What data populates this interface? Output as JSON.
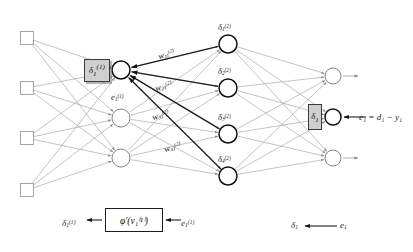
{
  "figure": {
    "background_color": "#ffffff",
    "line_color": "#a9a9a9",
    "dark_line_color": "#1c1c1c",
    "node_stroke_color": "#6f6f6f",
    "highlight_node_stroke_color": "#111111",
    "box_fill_color": "#cfcfcf",
    "box_stroke_color": "#3a3a3a"
  },
  "layers": {
    "input": {
      "name": "input-layer",
      "shape": "square",
      "count": 4,
      "x": 27,
      "ys": [
        38,
        88,
        138,
        190
      ],
      "size": 13
    },
    "hidden1": {
      "name": "hidden-layer-1",
      "shape": "circle",
      "count": 3,
      "x": 121,
      "ys": [
        70,
        118,
        158
      ],
      "radius": 9,
      "highlight_index": 0
    },
    "hidden2": {
      "name": "hidden-layer-2",
      "shape": "circle",
      "count": 4,
      "x": 228,
      "ys": [
        44,
        88,
        134,
        176
      ],
      "radius": 9,
      "highlight_all": true
    },
    "output": {
      "name": "output-layer",
      "shape": "circle",
      "count": 3,
      "x": 333,
      "ys": [
        76,
        117,
        158
      ],
      "radius": 8,
      "highlight_index": 1
    }
  },
  "delta_boxes": [
    {
      "name": "delta-box-hidden1-neuron1",
      "label_base": "δ",
      "label_sub": "1",
      "label_sup": "(1)",
      "x": 84,
      "y": 59,
      "width": 26,
      "height": 23
    },
    {
      "name": "delta-box-output-neuron1",
      "label_base": "δ",
      "label_sub": "1",
      "label_sup": "",
      "x": 308,
      "y": 104,
      "width": 14,
      "height": 26
    }
  ],
  "hidden2_labels": [
    {
      "name": "delta-label-hidden2-1",
      "base": "δ",
      "sub": "1",
      "sup": "(2)",
      "x": 218,
      "y": 23
    },
    {
      "name": "delta-label-hidden2-2",
      "base": "δ",
      "sub": "2",
      "sup": "(2)",
      "x": 218,
      "y": 67
    },
    {
      "name": "delta-label-hidden2-3",
      "base": "δ",
      "sub": "3",
      "sup": "(2)",
      "x": 218,
      "y": 113
    },
    {
      "name": "delta-label-hidden2-4",
      "base": "δ",
      "sub": "4",
      "sup": "(2)",
      "x": 218,
      "y": 155
    }
  ],
  "weight_labels": [
    {
      "name": "weight-label-w11",
      "base": "w",
      "sub": "11",
      "sup": "(2)",
      "x": 160,
      "y": 52
    },
    {
      "name": "weight-label-w21",
      "base": "w",
      "sub": "21",
      "sup": "(2)",
      "x": 157,
      "y": 84
    },
    {
      "name": "weight-label-w31",
      "base": "w",
      "sub": "31",
      "sup": "(2)",
      "x": 154,
      "y": 113
    },
    {
      "name": "weight-label-w41",
      "base": "w",
      "sub": "41",
      "sup": "(2)",
      "x": 166,
      "y": 145
    }
  ],
  "error_label_hidden1": {
    "name": "error-label-hidden1-neuron1",
    "base": "e",
    "sub": "1",
    "sup": "(1)",
    "x": 111,
    "y": 93
  },
  "output_equation": {
    "name": "output-error-equation",
    "text": "e₁ = d₁ − y₁",
    "x": 359,
    "y": 113
  },
  "bottom_flow": {
    "left_label": {
      "name": "bottom-delta-label",
      "base": "δ",
      "sub": "1",
      "sup": "(1)",
      "x": 62,
      "y": 219
    },
    "phi_box": {
      "name": "phi-derivative-box",
      "text": "φ′(v₁⁽¹⁾)",
      "x": 105,
      "y": 208,
      "width": 58,
      "height": 24
    },
    "right_label": {
      "name": "bottom-error-label",
      "base": "e",
      "sub": "1",
      "sup": "(1)",
      "x": 181,
      "y": 219
    },
    "out_delta_label": {
      "name": "bottom-output-delta-label",
      "base": "δ",
      "sub": "1",
      "sup": "",
      "x": 291,
      "y": 221
    },
    "out_error_label": {
      "name": "bottom-output-error-label",
      "base": "e",
      "sub": "1",
      "sup": "",
      "x": 340,
      "y": 221
    }
  }
}
